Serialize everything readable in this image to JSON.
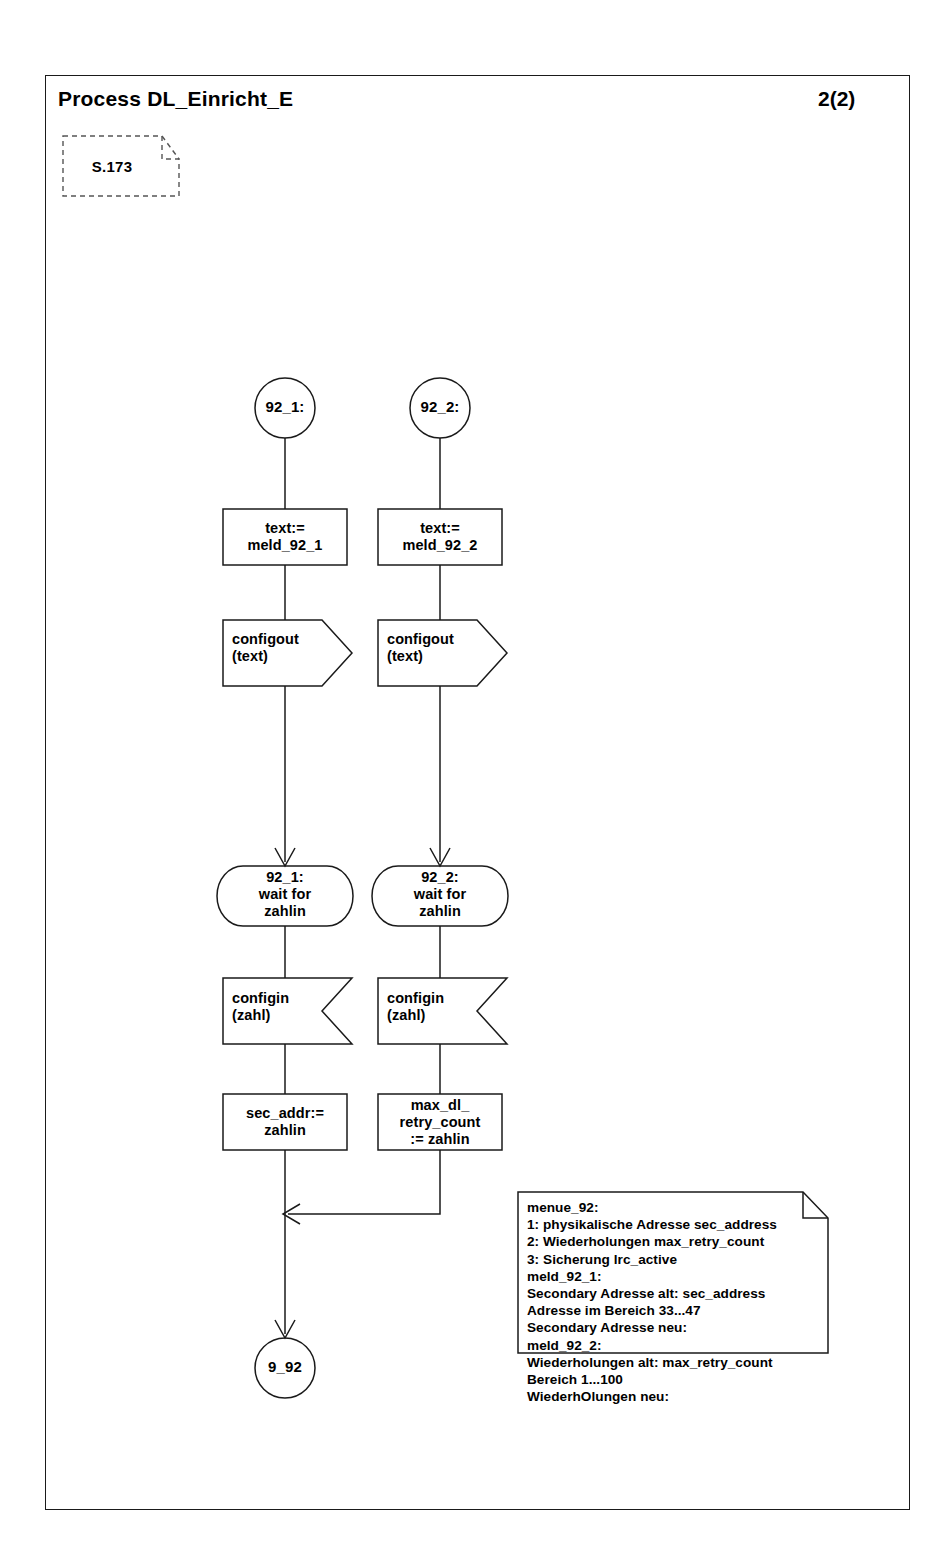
{
  "header": {
    "title": "Process DL_Einricht_E",
    "page_number": "2(2)"
  },
  "reference_box": {
    "label": "S.173"
  },
  "branches": [
    {
      "id": "branch-1",
      "start_state": "92_1:",
      "task_assign": "text:=\nmeld_92_1",
      "output": "configout\n(text)",
      "state": "92_1:\nwait for\nzahlin",
      "input": "configin\n(zahl)",
      "task_result": "sec_addr:=\nzahlin"
    },
    {
      "id": "branch-2",
      "start_state": "92_2:",
      "task_assign": "text:=\nmeld_92_2",
      "output": "configout\n(text)",
      "state": "92_2:\nwait for\nzahlin",
      "input": "configin\n(zahl)",
      "task_result": "max_dl_\nretry_count\n:= zahlin"
    }
  ],
  "terminal": {
    "label": "9_92"
  },
  "note": {
    "lines": [
      "menue_92:",
      "1: physikalische Adresse sec_address",
      "2: Wiederholungen max_retry_count",
      "3: Sicherung lrc_active",
      "meld_92_1:",
      "Secondary Adresse alt: sec_address",
      "Adresse im Bereich 33...47",
      "Secondary Adresse neu:",
      "meld_92_2:",
      "Wiederholungen alt: max_retry_count",
      "Bereich 1...100",
      "WiederhOlungen neu:"
    ],
    "text": "menue_92:\n1: physikalische Adresse sec_address\n2: Wiederholungen max_retry_count\n3: Sicherung lrc_active\nmeld_92_1:\nSecondary Adresse alt: sec_address\nAdresse im Bereich 33...47\nSecondary Adresse neu:\nmeld_92_2:\nWiederholungen alt: max_retry_count\nBereich 1...100\nWiederhOlungen neu:"
  },
  "colors": {
    "stroke": "#1a1a1a",
    "background": "#ffffff",
    "text": "#000000"
  }
}
